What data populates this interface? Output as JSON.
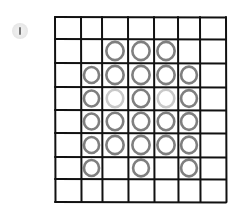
{
  "badge": {
    "icon": "info-icon",
    "glyph": "|"
  },
  "board": {
    "columns": 7,
    "rows": 8,
    "col_lines": [
      55,
      81,
      102,
      128,
      154,
      178,
      200,
      226
    ],
    "row_lines": [
      17,
      39,
      63,
      87,
      110,
      133,
      157,
      179,
      202
    ],
    "line_color": "#111111",
    "circle_dark_color": "#7f7f7f",
    "circle_light_color": "#c9c9c9",
    "cells": [
      [
        0,
        0,
        0,
        0,
        0,
        0,
        0
      ],
      [
        0,
        0,
        1,
        1,
        1,
        0,
        0
      ],
      [
        0,
        1,
        1,
        1,
        1,
        1,
        0
      ],
      [
        0,
        1,
        2,
        1,
        2,
        1,
        0
      ],
      [
        0,
        1,
        1,
        1,
        1,
        1,
        0
      ],
      [
        0,
        1,
        1,
        1,
        1,
        1,
        0
      ],
      [
        0,
        1,
        0,
        1,
        0,
        1,
        0
      ],
      [
        0,
        0,
        0,
        0,
        0,
        0,
        0
      ]
    ],
    "legend": {
      "0": "empty",
      "1": "dark-circle",
      "2": "light-circle"
    }
  }
}
